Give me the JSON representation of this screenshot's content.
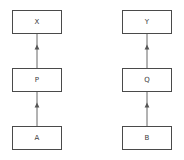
{
  "diagram": {
    "background_color": "#ffffff",
    "node_border_color": "#4a4a4a",
    "node_fill_color": "#ffffff",
    "edge_color": "#555555",
    "label_color": "#3a3a3a",
    "columns": [
      {
        "name": "left-chain",
        "nodes": [
          {
            "id": "x",
            "label": "X",
            "x": 12,
            "y": 10,
            "w": 50,
            "h": 24
          },
          {
            "id": "p",
            "label": "P",
            "x": 12,
            "y": 68,
            "w": 50,
            "h": 24
          },
          {
            "id": "a",
            "label": "A",
            "x": 12,
            "y": 126,
            "w": 50,
            "h": 24
          }
        ],
        "edges": [
          {
            "id": "p-to-x",
            "from": "p",
            "to": "x",
            "direction": "up",
            "x": 37,
            "y1": 68,
            "y2": 34,
            "marker_y": 48
          },
          {
            "id": "a-to-p",
            "from": "a",
            "to": "p",
            "direction": "up",
            "x": 37,
            "y1": 126,
            "y2": 92,
            "marker_y": 106
          }
        ]
      },
      {
        "name": "right-chain",
        "nodes": [
          {
            "id": "y",
            "label": "Y",
            "x": 122,
            "y": 10,
            "w": 50,
            "h": 24
          },
          {
            "id": "q",
            "label": "Q",
            "x": 122,
            "y": 68,
            "w": 50,
            "h": 24
          },
          {
            "id": "b",
            "label": "B",
            "x": 122,
            "y": 126,
            "w": 50,
            "h": 24
          }
        ],
        "edges": [
          {
            "id": "q-to-y",
            "from": "q",
            "to": "y",
            "direction": "up",
            "x": 147,
            "y1": 68,
            "y2": 34,
            "marker_y": 48
          },
          {
            "id": "b-to-q",
            "from": "b",
            "to": "q",
            "direction": "up",
            "x": 147,
            "y1": 126,
            "y2": 92,
            "marker_y": 106
          }
        ]
      }
    ]
  }
}
